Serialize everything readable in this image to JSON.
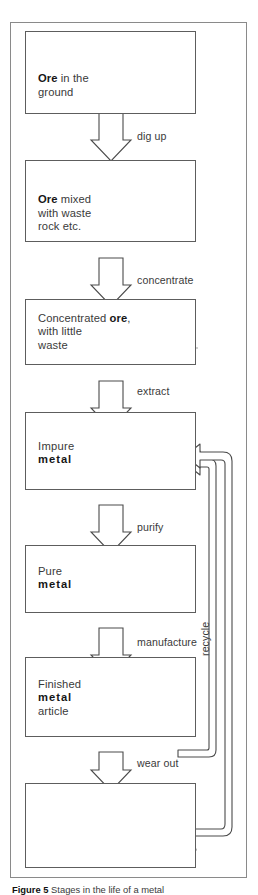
{
  "figure": {
    "caption_prefix": "Figure 5",
    "caption_text": "Stages in the life of a metal",
    "frame_name": "flowchart-frame"
  },
  "stages": [
    {
      "id": "ore-in-ground",
      "label_html": "Ore in the\nground",
      "label_bold": "Ore",
      "label_rest": " in the\nground",
      "art": "geological-cross-section"
    },
    {
      "id": "ore-with-waste",
      "label_bold": "Ore",
      "label_rest": " mixed\nwith waste\nrock etc.",
      "art": "rock-pile"
    },
    {
      "id": "concentrated-ore",
      "label_bold": "ore",
      "label_pre": "Concentrated ",
      "label_rest": ",\nwith little\nwaste",
      "art": "concentrate-heap"
    },
    {
      "id": "impure-metal",
      "label_pre": "Impure\n",
      "label_bold": "metal",
      "label_rest": "",
      "art": "rough-ingot"
    },
    {
      "id": "pure-metal",
      "label_pre": "Pure\n",
      "label_bold": "metal",
      "label_rest": "",
      "art": "shiny-ingot"
    },
    {
      "id": "finished-article",
      "label_pre": "Finished\n",
      "label_bold": "metal",
      "label_rest": "\narticle",
      "art": "saucepan"
    },
    {
      "id": "worn-out-article",
      "label_pre": "",
      "label_bold": "",
      "label_rest": "",
      "art": "worn-saucepan"
    }
  ],
  "transitions": [
    {
      "id": "dig-up",
      "label": "dig up"
    },
    {
      "id": "concentrate",
      "label": "concentrate"
    },
    {
      "id": "extract",
      "label": "extract"
    },
    {
      "id": "purify",
      "label": "purify"
    },
    {
      "id": "manufacture",
      "label": "manufacture"
    },
    {
      "id": "wear-out",
      "label": "wear out"
    }
  ],
  "recycle": {
    "label": "recycle"
  },
  "colors": {
    "frame_stroke": "#8a8a8a",
    "box_stroke": "#5d5d5d",
    "arrow_stroke": "#4a4a4a",
    "text": "#3a3a3a",
    "text_bold": "#161616",
    "metal_fill": "#9b9b9b",
    "metal_light": "#e8e8e8",
    "rock_fill": "#b4b4b4"
  }
}
